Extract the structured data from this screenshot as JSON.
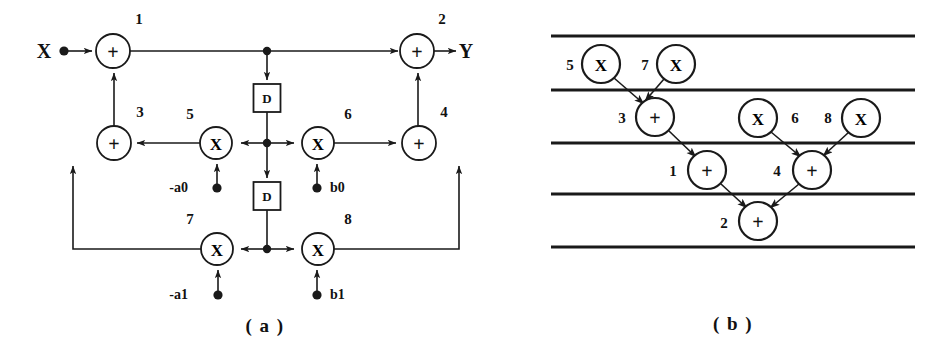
{
  "figure": {
    "width": 946,
    "height": 358,
    "background": "#ffffff",
    "ink": "#1a1a1a"
  },
  "panel_a": {
    "caption": "( a )",
    "caption_x": 265,
    "caption_y": 332,
    "input_label": "X",
    "input_label_x": 44,
    "input_label_y": 58,
    "output_label": "Y",
    "output_label_x": 466,
    "output_label_y": 58,
    "adders": [
      {
        "id": "1",
        "glyph": "+",
        "cx": 113,
        "cy": 51,
        "r": 17,
        "label": "1",
        "label_x": 139,
        "label_y": 24
      },
      {
        "id": "2",
        "glyph": "+",
        "cx": 417,
        "cy": 51,
        "r": 17,
        "label": "2",
        "label_x": 442,
        "label_y": 24
      },
      {
        "id": "3",
        "glyph": "+",
        "cx": 114,
        "cy": 143,
        "r": 17,
        "label": "3",
        "label_x": 140,
        "label_y": 117
      },
      {
        "id": "4",
        "glyph": "+",
        "cx": 419,
        "cy": 143,
        "r": 17,
        "label": "4",
        "label_x": 444,
        "label_y": 117
      }
    ],
    "multipliers": [
      {
        "id": "5",
        "glyph": "X",
        "cx": 216,
        "cy": 143,
        "r": 16,
        "label": "5",
        "label_x": 190,
        "label_y": 119
      },
      {
        "id": "6",
        "glyph": "X",
        "cx": 318,
        "cy": 143,
        "r": 16,
        "label": "6",
        "label_x": 348,
        "label_y": 119
      },
      {
        "id": "7",
        "glyph": "X",
        "cx": 217,
        "cy": 249,
        "r": 16,
        "label": "7",
        "label_x": 190,
        "label_y": 224
      },
      {
        "id": "8",
        "glyph": "X",
        "cx": 318,
        "cy": 249,
        "r": 16,
        "label": "8",
        "label_x": 348,
        "label_y": 224
      }
    ],
    "delays": [
      {
        "id": "D-upper",
        "glyph": "D",
        "cx": 267,
        "cy": 98,
        "w": 27,
        "h": 28
      },
      {
        "id": "D-lower",
        "glyph": "D",
        "cx": 267,
        "cy": 196,
        "w": 27,
        "h": 28
      }
    ],
    "coefficients": [
      {
        "name": "-a0",
        "label": "-a0",
        "label_x": 188,
        "label_y": 192,
        "dot_x": 217,
        "dot_y": 188
      },
      {
        "name": "b0",
        "label": "b0",
        "label_x": 330,
        "label_y": 192,
        "dot_x": 317,
        "dot_y": 188
      },
      {
        "name": "-a1",
        "label": "-a1",
        "label_x": 188,
        "label_y": 299,
        "dot_x": 218,
        "dot_y": 295
      },
      {
        "name": "b1",
        "label": "b1",
        "label_x": 330,
        "label_y": 299,
        "dot_x": 317,
        "dot_y": 295
      }
    ],
    "junctions": [
      {
        "name": "top-tap",
        "x": 267,
        "y": 51
      },
      {
        "name": "middle-tap",
        "x": 267,
        "y": 143
      },
      {
        "name": "bottom-tap",
        "x": 267,
        "y": 249
      }
    ],
    "input_dot": {
      "x": 64,
      "y": 51
    }
  },
  "panel_b": {
    "caption": "( b )",
    "caption_x": 733,
    "caption_y": 330,
    "timelines": [
      {
        "name": "time-step-line-1",
        "y": 36,
        "x1": 551,
        "x2": 915
      },
      {
        "name": "time-step-line-2",
        "y": 90,
        "x1": 551,
        "x2": 915
      },
      {
        "name": "time-step-line-3",
        "y": 143,
        "x1": 551,
        "x2": 915
      },
      {
        "name": "time-step-line-4",
        "y": 194,
        "x1": 551,
        "x2": 915
      },
      {
        "name": "time-step-line-5",
        "y": 247,
        "x1": 551,
        "x2": 915
      }
    ],
    "nodes": [
      {
        "id": "5",
        "type": "multiplier",
        "glyph": "X",
        "cx": 601,
        "cy": 64,
        "r": 19,
        "label": "5",
        "label_x": 570,
        "label_y": 70
      },
      {
        "id": "7",
        "type": "multiplier",
        "glyph": "X",
        "cx": 676,
        "cy": 64,
        "r": 19,
        "label": "7",
        "label_x": 645,
        "label_y": 70
      },
      {
        "id": "3",
        "type": "adder",
        "glyph": "+",
        "cx": 655,
        "cy": 117,
        "r": 19,
        "label": "3",
        "label_x": 622,
        "label_y": 123
      },
      {
        "id": "6",
        "type": "multiplier",
        "glyph": "X",
        "cx": 758,
        "cy": 118,
        "r": 19,
        "label": "6",
        "label_x": 795,
        "label_y": 123
      },
      {
        "id": "8",
        "type": "multiplier",
        "glyph": "X",
        "cx": 861,
        "cy": 118,
        "r": 19,
        "label": "8",
        "label_x": 828,
        "label_y": 123
      },
      {
        "id": "1",
        "type": "adder",
        "glyph": "+",
        "cx": 707,
        "cy": 170,
        "r": 19,
        "label": "1",
        "label_x": 673,
        "label_y": 176
      },
      {
        "id": "4",
        "type": "adder",
        "glyph": "+",
        "cx": 812,
        "cy": 170,
        "r": 19,
        "label": "4",
        "label_x": 777,
        "label_y": 176
      },
      {
        "id": "2",
        "type": "adder",
        "glyph": "+",
        "cx": 758,
        "cy": 221,
        "r": 19,
        "label": "2",
        "label_x": 724,
        "label_y": 228
      }
    ],
    "edges": [
      {
        "from": "5",
        "to": "3"
      },
      {
        "from": "7",
        "to": "3"
      },
      {
        "from": "3",
        "to": "1"
      },
      {
        "from": "6",
        "to": "4"
      },
      {
        "from": "8",
        "to": "4"
      },
      {
        "from": "1",
        "to": "2"
      },
      {
        "from": "4",
        "to": "2"
      }
    ]
  }
}
